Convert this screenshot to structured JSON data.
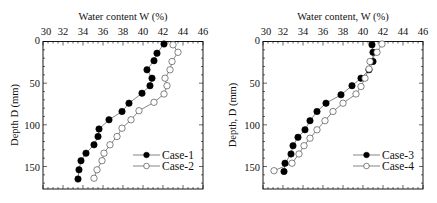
{
  "chart_data": [
    {
      "type": "line",
      "title": "Water content W (%)",
      "xlabel": "Water content W (%)",
      "ylabel": "Depth D (mm)",
      "xlim": [
        30,
        46
      ],
      "ylim": [
        0,
        177
      ],
      "y_inverted": true,
      "x_axis_position": "top",
      "xticks": [
        "30",
        "32",
        "34",
        "36",
        "38",
        "40",
        "42",
        "44",
        "46"
      ],
      "yticks": [
        "0",
        "50",
        "100",
        "150"
      ],
      "legend_position": "bottom-right",
      "series": [
        {
          "name": "Case-1",
          "marker": "filled-circle",
          "points": [
            [
              42.1,
              3
            ],
            [
              41.4,
              14
            ],
            [
              41.1,
              23
            ],
            [
              40.4,
              34
            ],
            [
              40.9,
              44
            ],
            [
              40.7,
              53
            ],
            [
              39.9,
              62
            ],
            [
              38.6,
              74
            ],
            [
              37.9,
              84
            ],
            [
              36.6,
              94
            ],
            [
              35.6,
              105
            ],
            [
              35.5,
              114
            ],
            [
              35.1,
              124
            ],
            [
              34.3,
              134
            ],
            [
              33.8,
              143
            ],
            [
              33.6,
              154
            ],
            [
              33.5,
              165
            ]
          ]
        },
        {
          "name": "Case-2",
          "marker": "open-circle",
          "points": [
            [
              43.0,
              4
            ],
            [
              43.5,
              13
            ],
            [
              42.9,
              24
            ],
            [
              42.7,
              34
            ],
            [
              42.2,
              44
            ],
            [
              42.4,
              53
            ],
            [
              42.1,
              63
            ],
            [
              41.1,
              73
            ],
            [
              39.6,
              83
            ],
            [
              38.8,
              94
            ],
            [
              37.9,
              104
            ],
            [
              37.4,
              114
            ],
            [
              36.7,
              124
            ],
            [
              36.1,
              134
            ],
            [
              35.9,
              143
            ],
            [
              35.4,
              154
            ],
            [
              35.1,
              164
            ]
          ]
        }
      ]
    },
    {
      "type": "line",
      "title": "Water content, W (%)",
      "xlabel": "Water content, W (%)",
      "ylabel": "Depth, D (mm)",
      "xlim": [
        30,
        46
      ],
      "ylim": [
        0,
        177
      ],
      "y_inverted": true,
      "x_axis_position": "top",
      "xticks": [
        "30",
        "32",
        "34",
        "36",
        "38",
        "40",
        "42",
        "44",
        "46"
      ],
      "yticks": [
        "0",
        "50",
        "100",
        "150"
      ],
      "legend_position": "bottom-right",
      "series": [
        {
          "name": "Case-3",
          "marker": "filled-circle",
          "points": [
            [
              40.9,
              4
            ],
            [
              41.0,
              13
            ],
            [
              41.0,
              24
            ],
            [
              40.6,
              34
            ],
            [
              39.8,
              44
            ],
            [
              38.9,
              53
            ],
            [
              37.8,
              64
            ],
            [
              36.3,
              74
            ],
            [
              35.4,
              84
            ],
            [
              34.7,
              95
            ],
            [
              34.2,
              106
            ],
            [
              33.5,
              115
            ],
            [
              33.0,
              125
            ],
            [
              32.8,
              135
            ],
            [
              32.2,
              146
            ],
            [
              32.1,
              156
            ]
          ]
        },
        {
          "name": "Case-4",
          "marker": "open-circle",
          "points": [
            [
              41.9,
              3
            ],
            [
              41.4,
              13
            ],
            [
              40.7,
              24
            ],
            [
              40.6,
              33
            ],
            [
              40.2,
              44
            ],
            [
              39.8,
              54
            ],
            [
              39.3,
              63
            ],
            [
              38.0,
              74
            ],
            [
              37.0,
              84
            ],
            [
              36.2,
              95
            ],
            [
              35.4,
              106
            ],
            [
              34.7,
              116
            ],
            [
              34.1,
              125
            ],
            [
              33.6,
              135
            ],
            [
              32.9,
              146
            ],
            [
              31.1,
              155
            ]
          ]
        }
      ]
    }
  ]
}
